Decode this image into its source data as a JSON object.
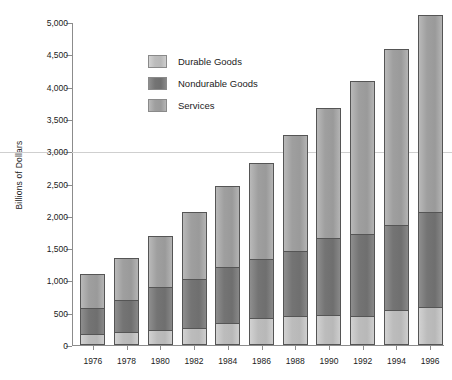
{
  "chart_data": {
    "type": "bar",
    "stacked": true,
    "title": "",
    "xlabel": "",
    "ylabel": "Billions of Dollars",
    "ylim": [
      0,
      5000
    ],
    "ytick_labels": [
      "5,000",
      "4,500",
      "4,000",
      "3,500",
      "3,000",
      "2,500",
      "2,000",
      "1,500",
      "1,000",
      "500",
      "0"
    ],
    "ytick_values": [
      5000,
      4500,
      4000,
      3500,
      3000,
      2500,
      2000,
      1500,
      1000,
      500,
      0
    ],
    "gridlines": [
      3000
    ],
    "grid": "single-horizontal-at-3000",
    "legend_position": "inside-upper-left",
    "categories": [
      "1976",
      "1978",
      "1980",
      "1982",
      "1984",
      "1986",
      "1988",
      "1990",
      "1992",
      "1994",
      "1996"
    ],
    "series": [
      {
        "name": "Durable Goods",
        "color": "#c4c4c4",
        "stack_order": "bottom",
        "values": [
          160,
          190,
          210,
          250,
          320,
          400,
          440,
          450,
          440,
          530,
          580
        ]
      },
      {
        "name": "Nondurable Goods",
        "color": "#797979",
        "stack_order": "middle",
        "values": [
          400,
          490,
          670,
          760,
          870,
          920,
          1000,
          1190,
          1270,
          1320,
          1470
        ]
      },
      {
        "name": "Services",
        "color": "#a5a5a5",
        "stack_order": "top",
        "values": [
          520,
          650,
          790,
          1040,
          1260,
          1480,
          1790,
          2020,
          2360,
          2710,
          3050
        ]
      }
    ],
    "totals": [
      1080,
      1330,
      1670,
      2050,
      2450,
      2800,
      3230,
      3660,
      4070,
      4560,
      5100
    ]
  },
  "legend": {
    "items": [
      {
        "label": "Durable Goods"
      },
      {
        "label": "Nondurable Goods"
      },
      {
        "label": "Services"
      }
    ]
  },
  "axis": {
    "y_title": "Billions of Dollars"
  }
}
